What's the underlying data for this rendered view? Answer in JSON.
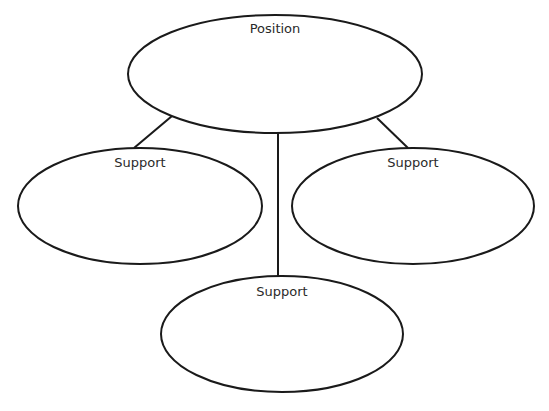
{
  "diagram": {
    "type": "position-support-organizer",
    "nodes": [
      {
        "id": "position",
        "label": "Position",
        "cx": 275,
        "cy": 74,
        "rx": 147,
        "ry": 59,
        "label_y": 21
      },
      {
        "id": "support-left",
        "label": "Support",
        "cx": 140,
        "cy": 206,
        "rx": 122,
        "ry": 58,
        "label_y": 155
      },
      {
        "id": "support-right",
        "label": "Support",
        "cx": 413,
        "cy": 206,
        "rx": 121,
        "ry": 58,
        "label_y": 155
      },
      {
        "id": "support-bottom",
        "label": "Support",
        "cx": 282,
        "cy": 334,
        "rx": 121,
        "ry": 58,
        "label_y": 284
      }
    ],
    "edges": [
      {
        "from": "position",
        "to": "support-left",
        "x1": 172,
        "y1": 116,
        "x2": 134,
        "y2": 148
      },
      {
        "from": "position",
        "to": "support-right",
        "x1": 377,
        "y1": 118,
        "x2": 408,
        "y2": 148
      },
      {
        "from": "position",
        "to": "support-bottom",
        "x1": 278,
        "y1": 133,
        "x2": 278,
        "y2": 276
      }
    ],
    "stroke_color": "#1a1a1a",
    "stroke_width": 2
  }
}
